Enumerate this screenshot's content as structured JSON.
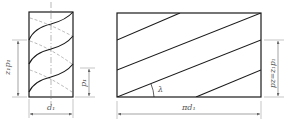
{
  "diagram": {
    "type": "helix-thread-unrolling",
    "colors": {
      "line": "#1a1a1a",
      "dim": "#666666",
      "dashed": "#9a9a9a",
      "text": "#555555"
    },
    "left_figure": {
      "name": "cylinder-with-helix",
      "labels": {
        "lead_height": "z₁p₁",
        "pitch": "p₁",
        "diameter": "d₁"
      }
    },
    "right_figure": {
      "name": "unrolled-helix",
      "labels": {
        "angle": "λ",
        "circumference": "πd₁",
        "lead": "pz=z₁p₁"
      }
    }
  }
}
